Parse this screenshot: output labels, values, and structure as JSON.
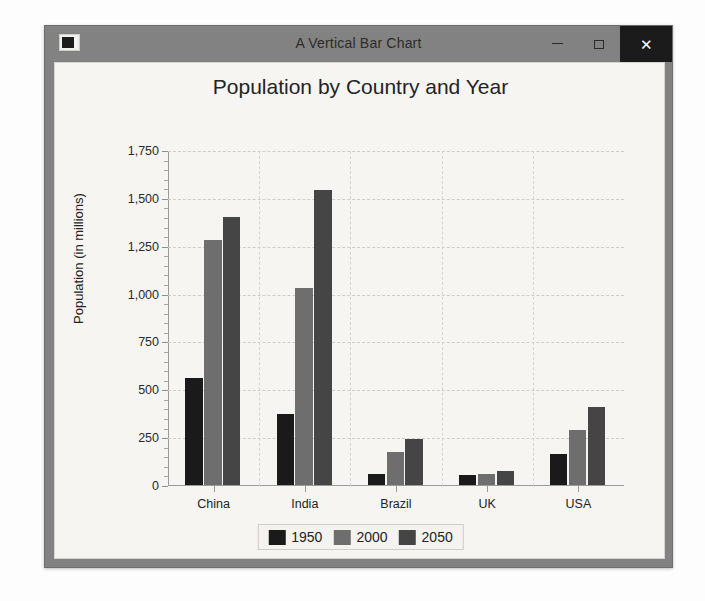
{
  "window": {
    "title": "A Vertical Bar Chart",
    "icon": "app-window-icon",
    "buttons": {
      "minimize": "–",
      "maximize": "□",
      "close": "✕"
    }
  },
  "chart_data": {
    "type": "bar",
    "title": "Population by Country and Year",
    "xlabel": "Country",
    "ylabel": "Population (in millions)",
    "categories": [
      "China",
      "India",
      "Brazil",
      "UK",
      "USA"
    ],
    "series": [
      {
        "name": "1950",
        "color": "#1a1a1a",
        "values": [
          560,
          370,
          55,
          50,
          160
        ]
      },
      {
        "name": "2000",
        "color": "#6e6e6e",
        "values": [
          1280,
          1030,
          175,
          60,
          285
        ]
      },
      {
        "name": "2050",
        "color": "#454545",
        "values": [
          1400,
          1540,
          240,
          72,
          410
        ]
      }
    ],
    "ylim": [
      0,
      1750
    ],
    "ytick_labels": [
      "0",
      "250",
      "500",
      "750",
      "1,000",
      "1,250",
      "1,500",
      "1,750"
    ],
    "ytick_values": [
      0,
      250,
      500,
      750,
      1000,
      1250,
      1500,
      1750
    ],
    "minor_tick_step": 50,
    "grid": true,
    "grid_axis": "both",
    "legend_position": "bottom",
    "legend_entries": [
      "1950",
      "2000",
      "2050"
    ]
  },
  "colors": {
    "window_frame": "#828282",
    "client_background": "#f6f5f2",
    "close_button": "#1b1b1b",
    "axis": "#9a9a9a",
    "grid": "#cfcdc8",
    "text": "#232323"
  }
}
